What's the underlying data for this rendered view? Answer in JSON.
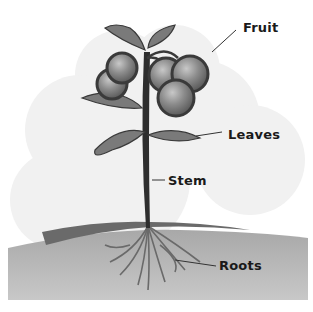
{
  "diagram": {
    "labels": {
      "fruit": "Fruit",
      "leaves": "Leaves",
      "stem": "Stem",
      "roots": "Roots"
    },
    "colors": {
      "background_cloud": "#f0f0f0",
      "ground": "#b8b8b8",
      "ground_top": "#6e6e6e",
      "stem": "#2e2e2e",
      "leaf": "#7a7a7a",
      "fruit": "#8a8a8a",
      "fruit_outline": "#3a3a3a",
      "roots": "#6a6a6a"
    }
  }
}
